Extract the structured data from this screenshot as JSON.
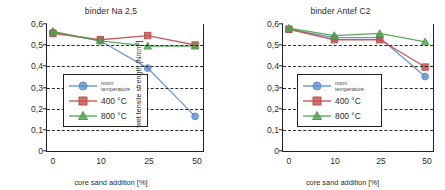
{
  "chart_data": [
    {
      "type": "line",
      "title": "binder Na 2,5",
      "xlabel": "core sand addition [%]",
      "ylabel": "wet tensile strength [N/cm²]",
      "categories": [
        "0",
        "10",
        "25",
        "50"
      ],
      "ytick_labels": [
        "0",
        "0,1",
        "0,2",
        "0,3",
        "0,4",
        "0,5",
        "0,6"
      ],
      "ylim": [
        0,
        0.6
      ],
      "grid": "horizontal-dashed",
      "legend_position": "inside-left-middle",
      "series": [
        {
          "name": "room temperature",
          "marker": "circle",
          "color": "#5b8fd0",
          "values": [
            0.56,
            0.52,
            0.39,
            0.16
          ]
        },
        {
          "name": "400 °C",
          "marker": "square",
          "color": "#c0504d",
          "values": [
            0.555,
            0.525,
            0.545,
            0.5
          ]
        },
        {
          "name": "800 °C",
          "marker": "triangle",
          "color": "#4ea24e",
          "values": [
            0.565,
            0.52,
            0.495,
            0.495
          ]
        }
      ]
    },
    {
      "type": "line",
      "title": "binder Antef C2",
      "xlabel": "core sand addition [%]",
      "ylabel": "wet tensile strength [N/cm²]",
      "categories": [
        "0",
        "10",
        "25",
        "50"
      ],
      "ytick_labels": [
        "0",
        "0,1",
        "0,2",
        "0,3",
        "0,4",
        "0,5",
        "0,6"
      ],
      "ylim": [
        0,
        0.6
      ],
      "grid": "horizontal-dashed",
      "legend_position": "inside-left-middle",
      "series": [
        {
          "name": "room temperature",
          "marker": "circle",
          "color": "#5b8fd0",
          "values": [
            0.575,
            0.535,
            0.535,
            0.35
          ]
        },
        {
          "name": "400 °C",
          "marker": "square",
          "color": "#c0504d",
          "values": [
            0.575,
            0.525,
            0.525,
            0.395
          ]
        },
        {
          "name": "800 °C",
          "marker": "triangle",
          "color": "#4ea24e",
          "values": [
            0.58,
            0.545,
            0.555,
            0.515
          ]
        }
      ]
    }
  ],
  "legend": {
    "room_temperature_line1": "room",
    "room_temperature_line2": "temperature",
    "label_400": "400 °C",
    "label_800": "800 °C"
  },
  "colors": {
    "room_temperature": "#5b8fd0",
    "t400": "#c0504d",
    "t800": "#4ea24e",
    "axis": "#231f20",
    "grid": "#2a2a2a",
    "background": "#ffffff"
  }
}
